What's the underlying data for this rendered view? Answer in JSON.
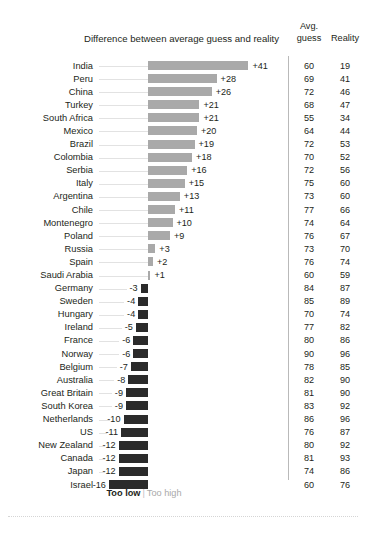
{
  "chart_data": {
    "type": "bar",
    "title": "Difference between average guess and reality",
    "xlabel": "",
    "ylabel": "",
    "orientation": "horizontal",
    "grid": false,
    "zero_line": true,
    "categories": [
      "India",
      "Peru",
      "China",
      "Turkey",
      "South Africa",
      "Mexico",
      "Brazil",
      "Colombia",
      "Serbia",
      "Italy",
      "Argentina",
      "Chile",
      "Montenegro",
      "Poland",
      "Russia",
      "Spain",
      "Saudi Arabia",
      "Germany",
      "Sweden",
      "Hungary",
      "Ireland",
      "France",
      "Norway",
      "Belgium",
      "Australia",
      "Great Britain",
      "South Korea",
      "Netherlands",
      "US",
      "New Zealand",
      "Canada",
      "Japan",
      "Israel"
    ],
    "values": [
      41,
      28,
      26,
      21,
      21,
      20,
      19,
      18,
      16,
      15,
      13,
      11,
      10,
      9,
      3,
      2,
      1,
      -3,
      -4,
      -4,
      -5,
      -6,
      -6,
      -7,
      -8,
      -9,
      -9,
      -10,
      -11,
      -12,
      -12,
      -12,
      -16
    ],
    "value_labels": [
      "+41",
      "+28",
      "+26",
      "+21",
      "+21",
      "+20",
      "+19",
      "+18",
      "+16",
      "+15",
      "+13",
      "+11",
      "+10",
      "+9",
      "+3",
      "+2",
      "+1",
      "-3",
      "-4",
      "-4",
      "-5",
      "-6",
      "-6",
      "-7",
      "-8",
      "-9",
      "-9",
      "-10",
      "-11",
      "-12",
      "-12",
      "-12",
      "-16"
    ],
    "series": [
      {
        "name": "Avg. guess",
        "values": [
          60,
          69,
          72,
          68,
          55,
          64,
          72,
          70,
          72,
          75,
          73,
          77,
          74,
          76,
          73,
          76,
          60,
          84,
          85,
          70,
          77,
          80,
          90,
          78,
          82,
          81,
          83,
          86,
          76,
          80,
          81,
          74,
          60
        ]
      },
      {
        "name": "Reality",
        "values": [
          19,
          41,
          46,
          47,
          34,
          44,
          53,
          52,
          56,
          60,
          60,
          66,
          64,
          67,
          70,
          74,
          59,
          87,
          89,
          74,
          82,
          86,
          96,
          85,
          90,
          90,
          92,
          96,
          87,
          92,
          93,
          86,
          76
        ]
      }
    ],
    "legend": {
      "position": "bottom-center",
      "too_low": "Too low",
      "separator": "|",
      "too_high": "Too high"
    },
    "colors": {
      "positive_bar": "#a9a9a9",
      "negative_bar": "#2b2b2b",
      "text": "#231f20",
      "leader_line": "#e2e2e2",
      "divider": "#b9b9b9",
      "background": "#ffffff"
    }
  },
  "headers": {
    "avg_line1": "Avg.",
    "avg_line2": "guess",
    "reality": "Reality"
  }
}
